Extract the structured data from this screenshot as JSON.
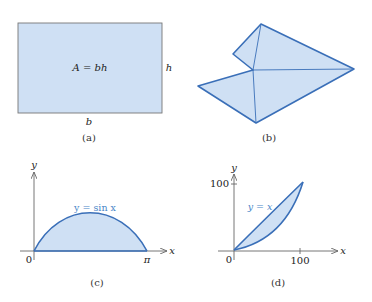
{
  "colors": {
    "fill": "#cfe0f4",
    "stroke_blue": "#3a6fb8",
    "label_blue": "#4a86c8",
    "axis": "#666666",
    "rect_border": "#777777"
  },
  "panels": [
    {
      "id": "a",
      "caption": "(a)",
      "shape": "rectangle",
      "formula": "A = bh",
      "side_label_right": "h",
      "side_label_bottom": "b"
    },
    {
      "id": "b",
      "caption": "(b)",
      "shape": "polygon triangulated into triangles",
      "vertices_px": [
        [
          261,
          24
        ],
        [
          354,
          69
        ],
        [
          256,
          123
        ],
        [
          198,
          86
        ],
        [
          253,
          70
        ],
        [
          233,
          54
        ]
      ],
      "diagonals_px": [
        [
          [
            261,
            24
          ],
          [
            253,
            70
          ]
        ],
        [
          [
            253,
            70
          ],
          [
            354,
            69
          ]
        ],
        [
          [
            253,
            70
          ],
          [
            256,
            123
          ]
        ]
      ]
    },
    {
      "id": "c",
      "caption": "(c)",
      "curve_label": "y = sin x",
      "x_axis_label": "x",
      "y_axis_label": "y",
      "origin_label": "0",
      "x_end_label": "π"
    },
    {
      "id": "d",
      "caption": "(d)",
      "curve_label": "y = x",
      "x_axis_label": "x",
      "y_axis_label": "y",
      "origin_label": "0",
      "x_tick_label": "100",
      "y_tick_label": "100"
    }
  ]
}
